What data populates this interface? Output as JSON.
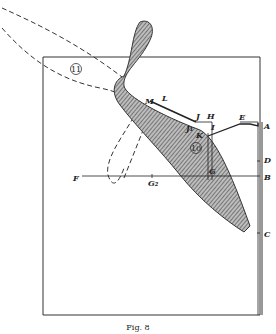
{
  "figure": {
    "caption": "Fig. 8",
    "labels": {
      "A": "A",
      "B": "B",
      "C": "C",
      "D": "D",
      "E": "E",
      "F": "F",
      "G": "G",
      "G2": "G₂",
      "H": "H",
      "I": "I",
      "J": "J",
      "J1": "J₁",
      "K": "K",
      "L": "L",
      "M": "M"
    },
    "circled_numbers": {
      "ten": "10",
      "eleven": "11"
    },
    "colors": {
      "ink": "#222222",
      "hatch_bg": "#9a9a9a",
      "background": "#ffffff"
    }
  }
}
